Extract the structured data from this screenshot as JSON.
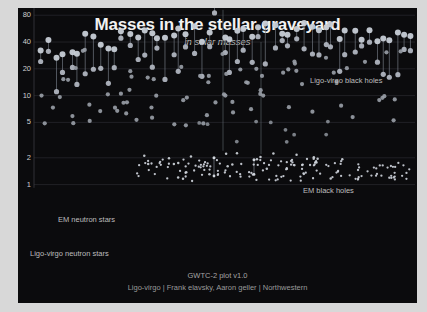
{
  "chart_data": {
    "type": "scatter",
    "title": "Masses in the stellar graveyard",
    "subtitle": "in solar masses",
    "xlabel": "",
    "ylabel": "",
    "yscale": "log",
    "ylim": [
      0.9,
      200
    ],
    "yticks": [
      160,
      80,
      40,
      20,
      10,
      5,
      2,
      1
    ],
    "ytick_labels": [
      "160",
      "80",
      "40",
      "20",
      "10",
      "5",
      "2",
      "1"
    ],
    "grid": true,
    "grid_color": "#2a2a30",
    "background_color": "#0b0b0d",
    "legend_position": "inline-annotations",
    "annotations": [
      {
        "text": "Ligo-virgo black holes",
        "x": 310,
        "y": 76,
        "color": "#bdbdbd"
      },
      {
        "text": "EM black holes",
        "x": 303,
        "y": 186,
        "color": "#bdbdbd"
      },
      {
        "text": "EM neutron stars",
        "x": 58,
        "y": 215,
        "color": "#bdbdbd"
      },
      {
        "text": "Ligo-virgo neutron stars",
        "x": 30,
        "y": 249,
        "color": "#bdbdbd"
      }
    ],
    "series": [
      {
        "name": "Ligo-virgo black holes",
        "marker": "circle-large",
        "color": "#c7cdd6",
        "point_count": 104,
        "description": "Binary black hole merger components connected by vertical lines; primary and secondary masses roughly 5-90 solar masses, with one outlier near 150."
      },
      {
        "name": "EM black holes",
        "marker": "circle-medium",
        "color": "#9aa0a8",
        "point_count": 76,
        "description": "Electromagnetically observed black holes, mostly 5-30 solar masses."
      },
      {
        "name": "EM neutron stars",
        "marker": "dot-small",
        "color": "#c9ced6",
        "point_count": 92,
        "description": "Electromagnetically observed neutron stars clustered near 1.4 solar masses."
      },
      {
        "name": "Ligo-virgo neutron stars",
        "marker": "dot-small",
        "color": "#c9ced6",
        "point_count": 24,
        "description": "Gravitational-wave detected neutron stars near 1-2 solar masses."
      }
    ]
  },
  "footer": {
    "line1": "GWTC-2 plot v1.0",
    "line2": "Ligo-virgo | Frank elavsky, Aaron geller | Northwestern"
  }
}
